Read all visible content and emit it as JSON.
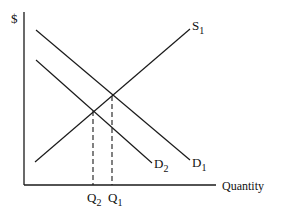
{
  "diagram": {
    "type": "supply-demand",
    "y_axis_label": "$",
    "x_axis_label": "Quantity",
    "curves": {
      "supply": {
        "label": "S",
        "subscript": "1"
      },
      "demand1": {
        "label": "D",
        "subscript": "1"
      },
      "demand2": {
        "label": "D",
        "subscript": "2"
      }
    },
    "quantities": {
      "q2": {
        "label": "Q",
        "subscript": "2"
      },
      "q1": {
        "label": "Q",
        "subscript": "1"
      }
    },
    "colors": {
      "line": "#1a1a1a",
      "background": "#ffffff"
    }
  }
}
